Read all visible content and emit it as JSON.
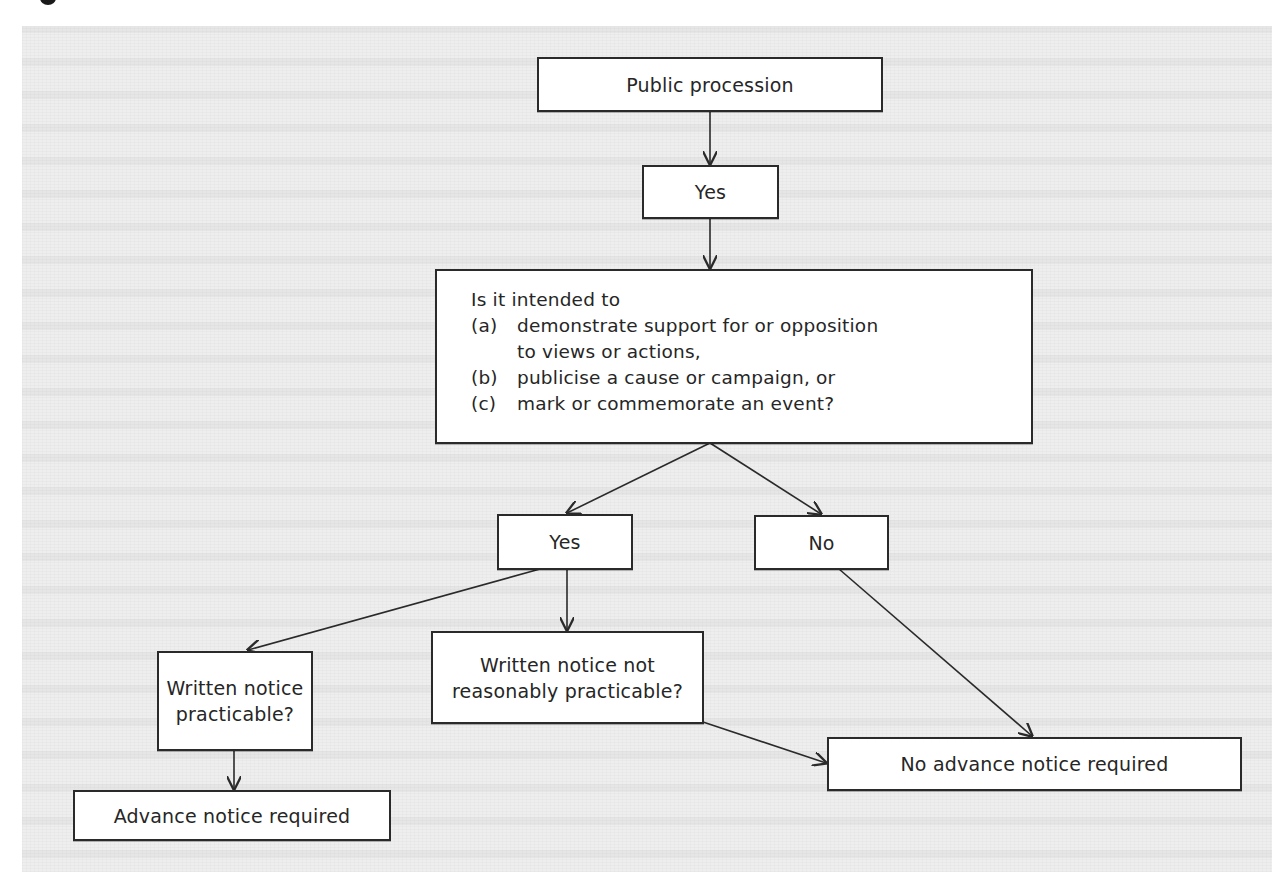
{
  "diagram": {
    "type": "flowchart",
    "colors": {
      "panel_background": "#eeeeee",
      "node_fill": "#ffffff",
      "node_border": "#2a2a2a",
      "text": "#262626"
    },
    "nodes": {
      "start": {
        "label": "Public procession"
      },
      "yes_top": {
        "label": "Yes"
      },
      "question": {
        "intro": "Is it intended to",
        "options": [
          {
            "marker": "(a)",
            "text": "demonstrate support for or opposition",
            "continuation": "to views or actions,"
          },
          {
            "marker": "(b)",
            "text": "publicise a cause or campaign, or"
          },
          {
            "marker": "(c)",
            "text": "mark or commemorate an event?"
          }
        ]
      },
      "yes_mid": {
        "label": "Yes"
      },
      "no_mid": {
        "label": "No"
      },
      "written_practicable": {
        "line1": "Written notice",
        "line2": "practicable?"
      },
      "written_not_practicable": {
        "line1": "Written notice not",
        "line2": "reasonably practicable?"
      },
      "advance_required": {
        "label": "Advance notice required"
      },
      "no_advance_required": {
        "label": "No advance notice required"
      }
    },
    "edges": [
      {
        "from": "start",
        "to": "yes_top"
      },
      {
        "from": "yes_top",
        "to": "question"
      },
      {
        "from": "question",
        "to": "yes_mid"
      },
      {
        "from": "question",
        "to": "no_mid"
      },
      {
        "from": "yes_mid",
        "to": "written_practicable"
      },
      {
        "from": "yes_mid",
        "to": "written_not_practicable"
      },
      {
        "from": "no_mid",
        "to": "no_advance_required"
      },
      {
        "from": "written_not_practicable",
        "to": "no_advance_required"
      },
      {
        "from": "written_practicable",
        "to": "advance_required"
      }
    ]
  }
}
